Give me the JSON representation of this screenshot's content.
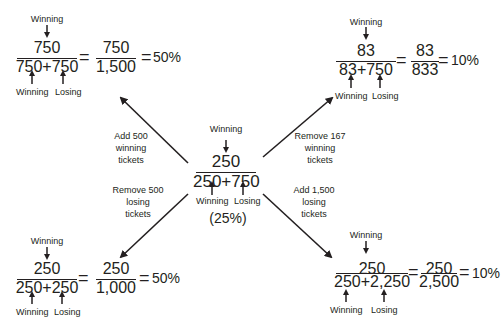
{
  "center": {
    "top_label": "Winning",
    "numerator": "250",
    "denominator": "250+750",
    "bottom_labels": [
      "Winning",
      "Losing"
    ],
    "percent": "(25%)"
  },
  "top_left": {
    "top_label": "Winning",
    "numerator": "750",
    "denominator": "750+750",
    "eq1": "=",
    "simplified_numerator": "750",
    "simplified_denominator": "1,500",
    "eq2": "=",
    "result": "50%",
    "bottom_labels": [
      "Winning",
      "Losing"
    ],
    "action": [
      "Add 500",
      "winning",
      "tickets"
    ]
  },
  "top_right": {
    "top_label": "Winning",
    "numerator": "83",
    "denominator": "83+750",
    "eq1": "=",
    "simplified_numerator": "83",
    "simplified_denominator": "833",
    "eq2": "=",
    "result": "10%",
    "bottom_labels": [
      "Winning",
      "Losing"
    ],
    "action": [
      "Remove 167",
      "winning",
      "tickets"
    ]
  },
  "bottom_left": {
    "top_label": "Winning",
    "numerator": "250",
    "denominator": "250+250",
    "eq1": "=",
    "simplified_numerator": "250",
    "simplified_denominator": "1,000",
    "eq2": "=",
    "result": "50%",
    "bottom_labels": [
      "Winning",
      "Losing"
    ],
    "action": [
      "Remove 500",
      "losing",
      "tickets"
    ]
  },
  "bottom_right": {
    "top_label": "Winning",
    "numerator": "250",
    "denominator": "250+2,250",
    "eq1": "=",
    "simplified_numerator": "250",
    "simplified_denominator": "2,500",
    "eq2": "=",
    "result": "10%",
    "bottom_labels": [
      "Winning",
      "Losing"
    ],
    "action": [
      "Add 1,500",
      "losing",
      "tickets"
    ]
  },
  "colors": {
    "ink": "#231f20",
    "background": "#ffffff"
  }
}
